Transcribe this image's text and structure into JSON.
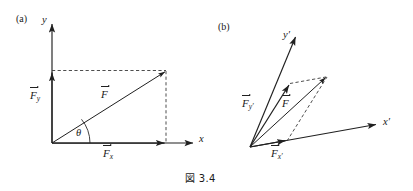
{
  "figure": {
    "caption": "図 3.4",
    "panels": [
      {
        "tag": "(a)",
        "tag_pos": {
          "x": 16,
          "y": 14
        },
        "axes": [
          {
            "name": "y-axis",
            "label": "y",
            "label_pos": {
              "x": 42,
              "y": 15
            }
          },
          {
            "name": "x-axis",
            "label": "x",
            "label_pos": {
              "x": 199,
              "y": 134
            }
          }
        ],
        "vectors": [
          {
            "name": "F",
            "base": "F",
            "sub": "",
            "label_pos": {
              "x": 101,
              "y": 89
            }
          },
          {
            "name": "Fy",
            "base": "F",
            "sub": "y",
            "label_pos": {
              "x": 30,
              "y": 90
            }
          },
          {
            "name": "Fx",
            "base": "F",
            "sub": "x",
            "label_pos": {
              "x": 103,
              "y": 148
            }
          }
        ],
        "angle": {
          "label": "θ",
          "label_pos": {
            "x": 76,
            "y": 128
          }
        }
      },
      {
        "tag": "(b)",
        "tag_pos": {
          "x": 218,
          "y": 22
        },
        "axes": [
          {
            "name": "y-prime-axis",
            "label": "y",
            "prime": "′",
            "label_pos": {
              "x": 283,
              "y": 30
            }
          },
          {
            "name": "x-prime-axis",
            "label": "x",
            "prime": "′",
            "label_pos": {
              "x": 383,
              "y": 117
            }
          }
        ],
        "vectors": [
          {
            "name": "F",
            "base": "F",
            "sub": "",
            "label_pos": {
              "x": 282,
              "y": 98
            }
          },
          {
            "name": "Fy-prime",
            "base": "F",
            "sub": "y′",
            "label_pos": {
              "x": 242,
              "y": 98
            }
          },
          {
            "name": "Fx-prime",
            "base": "F",
            "sub": "x′",
            "label_pos": {
              "x": 271,
              "y": 148
            }
          }
        ]
      }
    ],
    "caption_pos": {
      "x": 185,
      "y": 170
    },
    "colors": {
      "stroke": "#202020",
      "dashed": "#3a3a3a",
      "background": "#ffffff"
    },
    "geometry": {
      "panel_a": {
        "origin": [
          52,
          143
        ],
        "x_axis_end": [
          195,
          143
        ],
        "y_axis_end": [
          52,
          22
        ],
        "force_tip": [
          166,
          71
        ],
        "fx_tip": [
          166,
          143
        ],
        "fy_tip": [
          52,
          71
        ]
      },
      "panel_b": {
        "origin": [
          250,
          147
        ],
        "x_prime_axis_end": [
          378,
          124
        ],
        "y_prime_axis_end": [
          297,
          35
        ],
        "force_tip": [
          327,
          76
        ],
        "fx_prime_tip": [
          287,
          140
        ],
        "fy_prime_tip": [
          290,
          83
        ]
      }
    }
  }
}
